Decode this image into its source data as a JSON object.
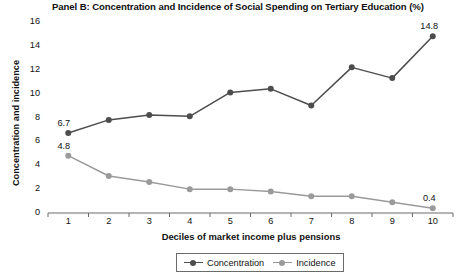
{
  "chart_data": {
    "type": "line",
    "title": "Panel B: Concentration and Incidence of Social Spending on Tertiary Education (%)",
    "xlabel": "Deciles of market income plus pensions",
    "ylabel": "Concentration and incidence",
    "categories": [
      "1",
      "2",
      "3",
      "4",
      "5",
      "6",
      "7",
      "8",
      "9",
      "10"
    ],
    "ylim": [
      0,
      16
    ],
    "yticks": [
      "0",
      "2",
      "4",
      "6",
      "8",
      "10",
      "12",
      "14",
      "16"
    ],
    "grid": false,
    "legend_position": "bottom",
    "series": [
      {
        "name": "Concentration",
        "color": "#4d4d4d",
        "values": [
          6.7,
          7.8,
          8.2,
          8.1,
          10.1,
          10.4,
          9.0,
          12.2,
          11.3,
          14.8
        ]
      },
      {
        "name": "Incidence",
        "color": "#9a9a9a",
        "values": [
          4.8,
          3.1,
          2.6,
          2.0,
          2.0,
          1.8,
          1.4,
          1.4,
          0.9,
          0.4
        ]
      }
    ],
    "annotations": [
      {
        "text": "6.7",
        "series": "Concentration",
        "decile": "1"
      },
      {
        "text": "14.8",
        "series": "Concentration",
        "decile": "10"
      },
      {
        "text": "4.8",
        "series": "Incidence",
        "decile": "1"
      },
      {
        "text": "0.4",
        "series": "Incidence",
        "decile": "10"
      }
    ]
  },
  "legend": {
    "items": [
      {
        "label": "Concentration"
      },
      {
        "label": "Incidence"
      }
    ]
  },
  "axis_color": "#6b6b6b"
}
